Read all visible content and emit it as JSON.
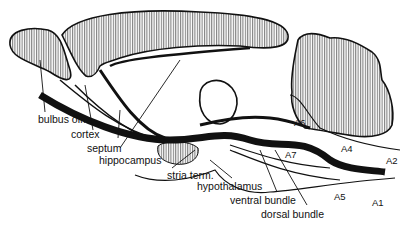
{
  "diagram": {
    "labels": {
      "bulbus_olf": "bulbus olf.",
      "cortex": "cortex",
      "septum": "septum",
      "hippocampus": "hippocampus",
      "stria_term": "stria term.",
      "hypothalamus": "hypothalamus",
      "ventral_bundle": "ventral bundle",
      "dorsal_bundle": "dorsal bundle",
      "a1": "A1",
      "a2": "A2",
      "a4": "A4",
      "a5": "A5",
      "a6": "A6",
      "a7": "A7"
    },
    "colors": {
      "ink": "#111111",
      "background": "#ffffff"
    }
  }
}
